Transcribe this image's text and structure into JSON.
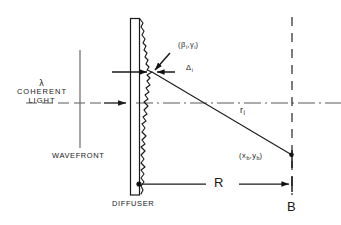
{
  "figure": {
    "colors": {
      "ink": "#1a1a1a",
      "axis": "#555555",
      "wavefront": "#666666",
      "background": "#ffffff"
    }
  },
  "labels": {
    "wavelength": "λ",
    "coherent": "COHERENT",
    "light": "LIGHT",
    "wavefront": "WAVEFRONT",
    "diffuser": "DIFFUSER",
    "scatter_point_open": "(",
    "scatter_point": "β",
    "scatter_point_sub": "i",
    "scatter_point_comma": ",",
    "scatter_point_2": "γ",
    "scatter_point_2_sub": "i",
    "scatter_point_close": ")",
    "delta": "Δ",
    "delta_sub": "i",
    "ray": "r",
    "ray_sub": "i",
    "observation_open": "(",
    "observation_x": "x",
    "observation_x_sub": "b",
    "observation_comma": ",",
    "observation_y": "y",
    "observation_y_sub": "b",
    "observation_close": ")",
    "distance": "R",
    "plane": "B"
  },
  "geometry": {
    "diffuser_x": 135,
    "diffuser_top": 18,
    "diffuser_bottom": 195,
    "plane_b_x": 292,
    "axis_y": 103,
    "scatter_x": 152,
    "scatter_y": 72,
    "observation_x": 292,
    "observation_y": 155,
    "wavefront_x": 80,
    "distance_label_R": "R"
  }
}
